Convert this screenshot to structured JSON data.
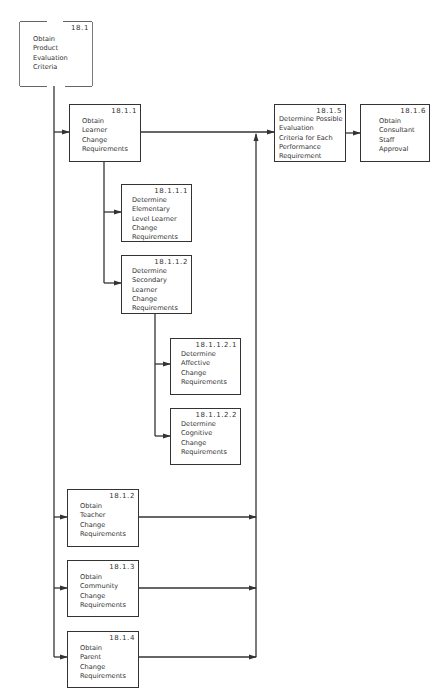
{
  "diagram": {
    "title": "Obtain Product Evaluation Criteria",
    "line_color": "#333333",
    "background": "#ffffff",
    "nodes": [
      {
        "id": "18.1",
        "label": "Obtain\nProduct\nEvaluation\nCriteria"
      },
      {
        "id": "18.1.1",
        "label": "Obtain\nLearner\nChange\nRequirements"
      },
      {
        "id": "18.1.1.1",
        "label": "Determine\nElementary\nLevel Learner\nChange\nRequirements"
      },
      {
        "id": "18.1.1.2",
        "label": "Determine\nSecondary\nLearner\nChange\nRequirements"
      },
      {
        "id": "18.1.1.2.1",
        "label": "Determine\nAffective\nChange\nRequirements"
      },
      {
        "id": "18.1.1.2.2",
        "label": "Determine\nCognitive\nChange\nRequirements"
      },
      {
        "id": "18.1.2",
        "label": "Obtain\nTeacher\nChange\nRequirements"
      },
      {
        "id": "18.1.3",
        "label": "Obtain\nCommunity\nChange\nRequirements"
      },
      {
        "id": "18.1.4",
        "label": "Obtain\nParent\nChange\nRequirements"
      },
      {
        "id": "18.1.5",
        "label": "Determine Possible\nEvaluation\nCriteria for Each\nPerformance\nRequirement"
      },
      {
        "id": "18.1.6",
        "label": "Obtain\nConsultant\nStaff\nApproval"
      }
    ],
    "edges": [
      {
        "from": "18.1",
        "to": "18.1.1"
      },
      {
        "from": "18.1",
        "to": "18.1.2"
      },
      {
        "from": "18.1",
        "to": "18.1.3"
      },
      {
        "from": "18.1",
        "to": "18.1.4"
      },
      {
        "from": "18.1.1",
        "to": "18.1.1.1"
      },
      {
        "from": "18.1.1",
        "to": "18.1.1.2"
      },
      {
        "from": "18.1.1.2",
        "to": "18.1.1.2.1"
      },
      {
        "from": "18.1.1.2",
        "to": "18.1.1.2.2"
      },
      {
        "from": "18.1.1",
        "to": "18.1.5"
      },
      {
        "from": "18.1.2",
        "to": "18.1.5"
      },
      {
        "from": "18.1.3",
        "to": "18.1.5"
      },
      {
        "from": "18.1.4",
        "to": "18.1.5"
      },
      {
        "from": "18.1.5",
        "to": "18.1.6"
      }
    ]
  }
}
